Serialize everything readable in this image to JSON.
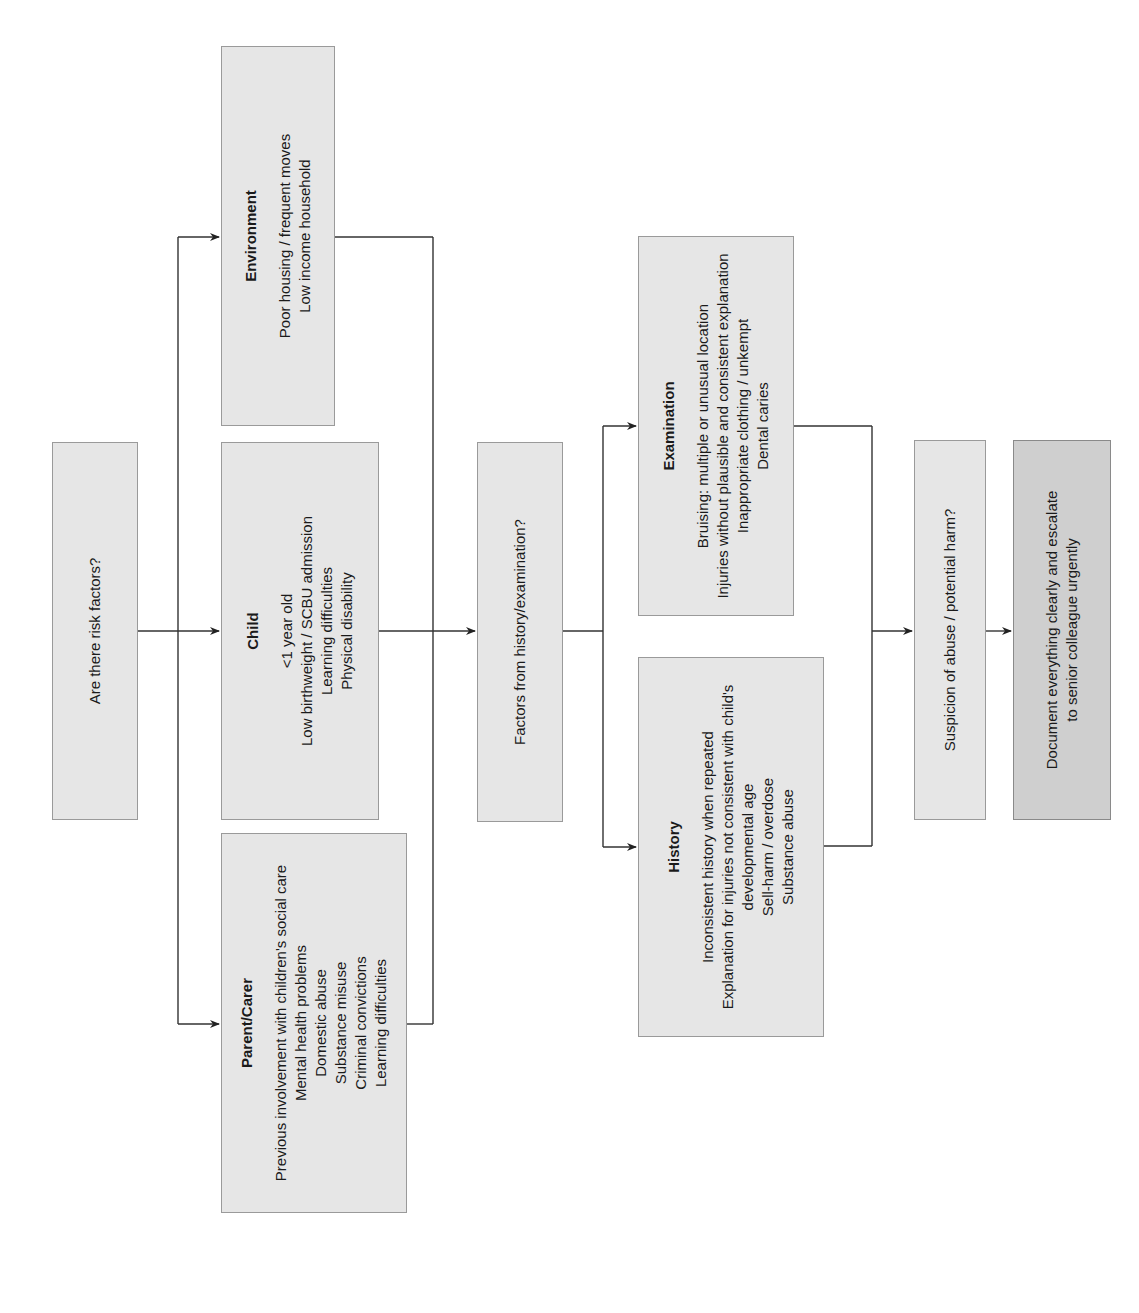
{
  "flowchart": {
    "start": {
      "label": "Are there risk factors?"
    },
    "risk_categories": [
      {
        "title": "Environment",
        "items": [
          "Poor housing / frequent moves",
          "Low income household"
        ]
      },
      {
        "title": "Child",
        "items": [
          "<1 year old",
          "Low birthweight / SCBU admission",
          "Learning difficulties",
          "Physical disability"
        ]
      },
      {
        "title": "Parent/Carer",
        "items": [
          "Previous involvement with children's social care",
          "Mental health problems",
          "Domestic abuse",
          "Substance misuse",
          "Criminal convictions",
          "Learning difficulties"
        ]
      }
    ],
    "factors": {
      "label": "Factors from history/examination?"
    },
    "findings": [
      {
        "title": "Examination",
        "items": [
          "Bruising: multiple or unusual location",
          "Injuries without plausible and consistent explanation",
          "Inappropriate clothing / unkempt",
          "Dental caries"
        ]
      },
      {
        "title": "History",
        "items": [
          "Inconsistent history when repeated",
          "Explanation for injuries not consistent with child's",
          "developmental age",
          "Sell-harm / overdose",
          "Substance abuse"
        ]
      }
    ],
    "suspicion": {
      "label": "Suspicion of abuse / potential harm?"
    },
    "action": {
      "lines": [
        "Document everything clearly and escalate",
        "to senior colleague urgently"
      ]
    }
  },
  "colors": {
    "box_fill": "#e6e6e6",
    "action_fill": "#cfcfcf",
    "border": "#9a9a9a",
    "line": "#333333"
  }
}
